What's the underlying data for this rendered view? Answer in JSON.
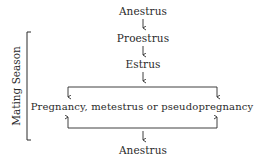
{
  "diagram": {
    "type": "flowchart",
    "title": "",
    "nodes": {
      "anestrus_top": "Anestrus",
      "proestrus": "Proestrus",
      "estrus": "Estrus",
      "pregnancy": "Pregnancy, metestrus or pseudopregnancy",
      "anestrus_bottom": "Anestrus"
    },
    "bracket_label": "Mating Season",
    "edges": [
      {
        "from": "Anestrus",
        "to": "Proestrus"
      },
      {
        "from": "Proestrus",
        "to": "Estrus"
      },
      {
        "from": "Estrus",
        "to": "Pregnancy, metestrus or pseudopregnancy"
      },
      {
        "from": "Pregnancy, metestrus or pseudopregnancy",
        "to": "Anestrus"
      }
    ],
    "colors": {
      "ink": "#2a2a2a",
      "background": "#ffffff"
    }
  }
}
